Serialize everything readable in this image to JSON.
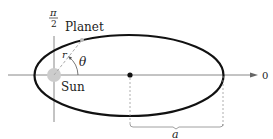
{
  "diagram": {
    "labels": {
      "pi": "π",
      "two": "2",
      "planet": "Planet",
      "sun": "Sun",
      "r": "r",
      "theta": "θ",
      "zero": "0",
      "a": "a"
    },
    "colors": {
      "ellipse": "#111111",
      "axes": "#888888",
      "sun": "#cccccc",
      "dashed": "#999999"
    }
  }
}
